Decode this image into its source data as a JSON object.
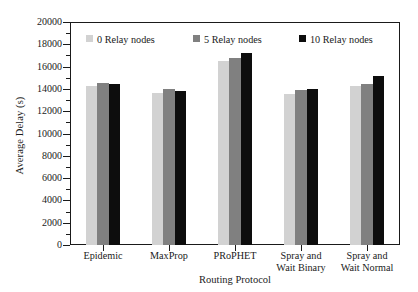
{
  "chart_data": {
    "type": "bar",
    "title": "",
    "xlabel": "Routing Protocol",
    "ylabel": "Average Delay (s)",
    "ylim": [
      0,
      20000
    ],
    "ytick_step": 2000,
    "ytick_labels": [
      "0",
      "2000",
      "4000",
      "6000",
      "8000",
      "10000",
      "12000",
      "14000",
      "16000",
      "18000",
      "20000"
    ],
    "ytick_values": [
      0,
      2000,
      4000,
      6000,
      8000,
      10000,
      12000,
      14000,
      16000,
      18000,
      20000
    ],
    "grid": false,
    "legend_position": "top-inside",
    "categories": [
      "Epidemic",
      "MaxProp",
      "PRoPHET",
      "Spray and Wait Binary",
      "Spray and Wait Normal"
    ],
    "category_lines": [
      [
        "Epidemic"
      ],
      [
        "MaxProp"
      ],
      [
        "PRoPHET"
      ],
      [
        "Spray and",
        "Wait Binary"
      ],
      [
        "Spray and",
        "Wait Normal"
      ]
    ],
    "series": [
      {
        "name": "0 Relay nodes",
        "color": "#d2d2d2",
        "values": [
          14300,
          13600,
          16500,
          13500,
          14250
        ]
      },
      {
        "name": "5 Relay nodes",
        "color": "#808080",
        "values": [
          14500,
          13950,
          16800,
          13900,
          14400
        ]
      },
      {
        "name": "10 Relay nodes",
        "color": "#0d0d0d",
        "values": [
          14400,
          13800,
          17200,
          14000,
          15200
        ]
      }
    ]
  },
  "axis": {
    "y_title": "Average Delay (s)",
    "x_title": "Routing Protocol"
  },
  "colors": {
    "axis": "#1a1a1a",
    "background": "#ffffff",
    "series_0": "#d2d2d2",
    "series_5": "#808080",
    "series_10": "#0d0d0d"
  }
}
